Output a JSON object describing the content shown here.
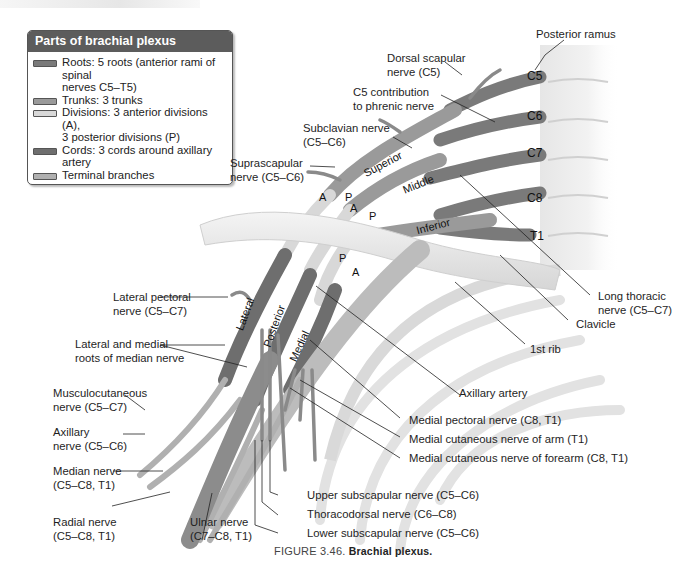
{
  "figure": {
    "caption_number": "FIGURE 3.46.",
    "caption_title": "Brachial plexus."
  },
  "legend": {
    "title": "Parts of brachial plexus",
    "items": [
      {
        "text": "Roots: 5 roots (anterior rami of spinal\n    nerves C5–T5)",
        "color": "#7a7a7a"
      },
      {
        "text": "Trunks: 3 trunks",
        "color": "#9a9a9a"
      },
      {
        "text": "Divisions: 3 anterior divisions (A),\n   3 posterior divisions (P)",
        "color": "#d8d8d8"
      },
      {
        "text": "Cords: 3 cords around axillary artery",
        "color": "#6e6e6e"
      },
      {
        "text": "Terminal branches",
        "color": "#b0b0b0"
      }
    ]
  },
  "roots": [
    "C5",
    "C6",
    "C7",
    "C8",
    "T1"
  ],
  "trunks": [
    "Superior",
    "Middle",
    "Inferior"
  ],
  "cords": [
    "Lateral",
    "Posterior",
    "Medial"
  ],
  "divisions": [
    "A",
    "P",
    "A",
    "P",
    "P",
    "A"
  ],
  "labels": {
    "posterior_ramus": "Posterior ramus",
    "dorsal_scapular": "Dorsal scapular\nnerve (C5)",
    "c5_phrenic": "C5 contribution\nto phrenic nerve",
    "subclavian": "Subclavian nerve\n(C5–C6)",
    "suprascapular": "Suprascapular\nnerve (C5–C6)",
    "long_thoracic": "Long thoracic\nnerve (C5–C7)",
    "clavicle": "Clavicle",
    "first_rib": "1st rib",
    "axillary_artery": "Axillary artery",
    "lateral_pectoral": "Lateral pectoral\nnerve (C5–C7)",
    "median_roots": "Lateral and medial\nroots of median nerve",
    "musculocutaneous": "Musculocutaneous\nnerve (C5–C7)",
    "axillary": "Axillary\nnerve (C5–C6)",
    "median": "Median nerve\n(C5–C8, T1)",
    "radial": "Radial nerve\n(C5–C8, T1)",
    "ulnar": "Ulnar nerve\n(C7–C8, T1)",
    "medial_pectoral": "Medial pectoral nerve (C8, T1)",
    "medial_cut_arm": "Medial cutaneous nerve of arm (T1)",
    "medial_cut_forearm": "Medial cutaneous nerve of forearm (C8, T1)",
    "upper_subscapular": "Upper subscapular nerve (C5–C6)",
    "thoracodorsal": "Thoracodorsal nerve (C6–C8)",
    "lower_subscapular": "Lower subscapular nerve (C5–C6)"
  }
}
